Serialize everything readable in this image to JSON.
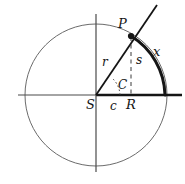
{
  "figure": {
    "name": "circle-geometry-diagram",
    "background": "#ffffff",
    "stroke_dark": "#151515",
    "stroke_light": "#6b6b6b",
    "width": 185,
    "height": 184,
    "center": {
      "x": 96,
      "y": 95
    },
    "radius": 71
  },
  "labels": {
    "point_p": "P",
    "arc_x": "x",
    "segment_s": "s",
    "radius_r": "r",
    "point_s": "S",
    "chord_c": "c",
    "point_r": "R",
    "angle_c": "C"
  },
  "geometry": {
    "circle": {
      "cx": 96,
      "cy": 95,
      "r": 71
    },
    "axis_horizontal": {
      "x1": 18,
      "y1": 95,
      "x2": 182,
      "y2": 95
    },
    "axis_vertical": {
      "x1": 96,
      "y1": 14,
      "x2": 96,
      "y2": 172
    },
    "point_p": {
      "x": 131,
      "y": 36
    },
    "point_r": {
      "x": 165,
      "y": 95
    },
    "point_s": {
      "x": 96,
      "y": 95
    },
    "ray_through_p": {
      "x1": 96,
      "y1": 95,
      "x2": 156,
      "y2": 6
    },
    "dashed_drop": {
      "x1": 131,
      "y1": 36,
      "x2": 131,
      "y2": 94
    },
    "thick_arc": {
      "from_x": 131,
      "from_y": 36,
      "to_x": 165,
      "to_y": 95,
      "sweep_r": 71
    },
    "angle_arc": {
      "cx": 96,
      "cy": 95,
      "r": 24
    }
  }
}
